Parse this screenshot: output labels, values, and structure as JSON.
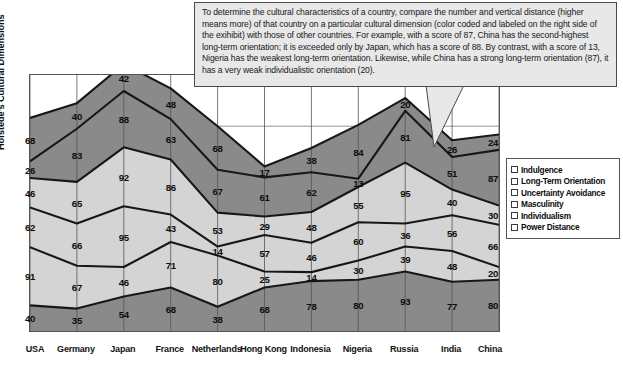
{
  "callout": {
    "text": "To determine the cultural characteristics of a country, compare the number and vertical distance (higher means more) of that country on a particular cultural dimension (color coded and labeled on the right side of the exihibit) with those of other countries. For example, with a score of 87, China has the second-highest long-term orientation; it is exceeded only by Japan, which has a score of 88. By contrast, with a score of 13, Nigeria has the weakest long-term orientation. Likewise, while China has a strong long-term orientation (87), it has a very weak individualistic orientation (20)."
  },
  "axis": {
    "ylabel": "Hofstede's Cultural Dimensions"
  },
  "legend": {
    "title": "",
    "items": [
      {
        "label": "Indulgence",
        "color": "#8a8a8a"
      },
      {
        "label": "Long-Term Orientation",
        "color": "#8a8a8a"
      },
      {
        "label": "Uncertainty Avoidance",
        "color": "#d4d4d4"
      },
      {
        "label": "Masculinity",
        "color": "#d4d4d4"
      },
      {
        "label": "Individualism",
        "color": "#d4d4d4"
      },
      {
        "label": "Power Distance",
        "color": "#8a8a8a"
      }
    ]
  },
  "chart_data": {
    "type": "area",
    "title": "",
    "xlabel": "",
    "ylabel": "Hofstede's Cultural Dimensions",
    "stacked": true,
    "grid": true,
    "legend_position": "right",
    "ylim": [
      0,
      400
    ],
    "categories": [
      "USA",
      "Germany",
      "Japan",
      "France",
      "Netherlands",
      "Hong Kong",
      "Indonesia",
      "Nigeria",
      "Russia",
      "India",
      "China"
    ],
    "series": [
      {
        "name": "Power Distance",
        "color": "#8a8a8a",
        "values": [
          40,
          35,
          54,
          68,
          38,
          68,
          78,
          80,
          93,
          77,
          80
        ]
      },
      {
        "name": "Individualism",
        "color": "#d4d4d4",
        "values": [
          91,
          67,
          46,
          71,
          80,
          25,
          14,
          30,
          39,
          48,
          20
        ]
      },
      {
        "name": "Masculinity",
        "color": "#d4d4d4",
        "values": [
          62,
          66,
          95,
          43,
          14,
          57,
          46,
          60,
          36,
          56,
          66
        ]
      },
      {
        "name": "Uncertainty Avoidance",
        "color": "#d4d4d4",
        "values": [
          46,
          65,
          92,
          86,
          53,
          29,
          48,
          55,
          95,
          40,
          30
        ]
      },
      {
        "name": "Long-Term Orientation",
        "color": "#8a8a8a",
        "values": [
          26,
          83,
          88,
          63,
          67,
          61,
          62,
          13,
          81,
          51,
          87
        ]
      },
      {
        "name": "Indulgence",
        "color": "#8a8a8a",
        "values": [
          68,
          40,
          42,
          48,
          68,
          17,
          38,
          84,
          20,
          26,
          24
        ]
      }
    ]
  }
}
